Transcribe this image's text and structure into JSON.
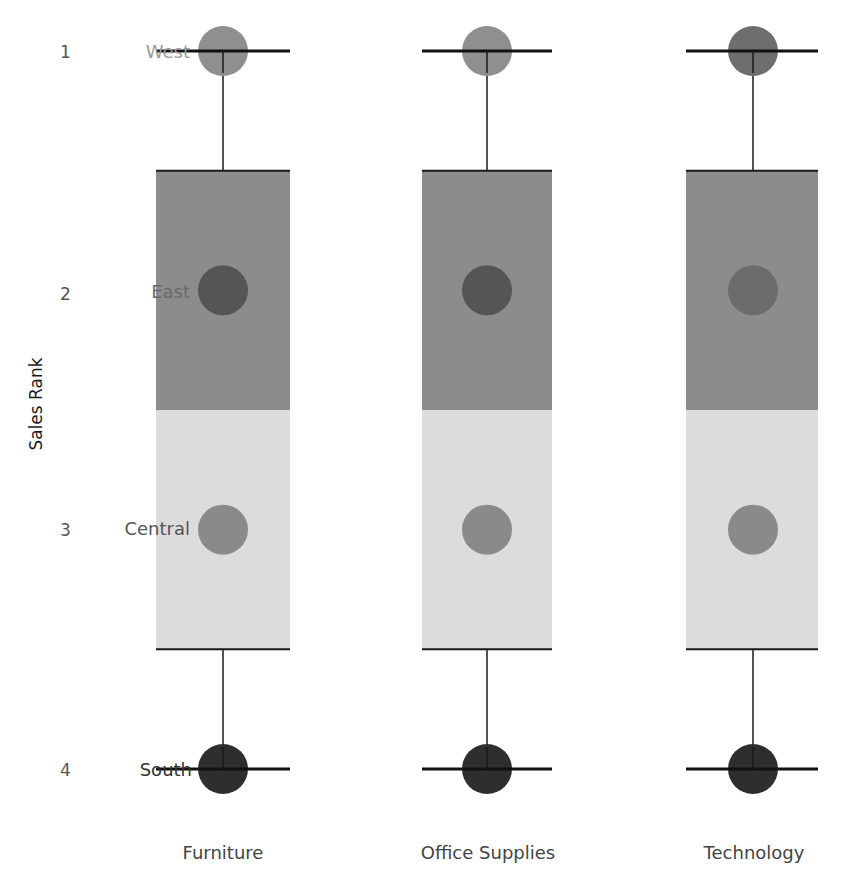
{
  "chart_data": {
    "type": "box-and-dot",
    "title": "",
    "xlabel": "",
    "ylabel": "Sales Rank",
    "ylim": [
      1,
      4
    ],
    "y_ticks": [
      "1",
      "2",
      "3",
      "4"
    ],
    "grid": false,
    "categories": [
      "Furniture",
      "Office Supplies",
      "Technology"
    ],
    "series": [
      {
        "name": "West",
        "values": [
          1,
          1,
          1
        ],
        "colors": [
          "#8f8f8f",
          "#8f8f8f",
          "#6e6e6e"
        ]
      },
      {
        "name": "East",
        "values": [
          2,
          2,
          2
        ],
        "colors": [
          "#555555",
          "#555555",
          "#6c6c6c"
        ]
      },
      {
        "name": "Central",
        "values": [
          3,
          3,
          3
        ],
        "colors": [
          "#8a8a8a",
          "#8a8a8a",
          "#8a8a8a"
        ]
      },
      {
        "name": "South",
        "values": [
          4,
          4,
          4
        ],
        "colors": [
          "#2e2e2e",
          "#2e2e2e",
          "#2e2e2e"
        ]
      }
    ],
    "box_plot": {
      "whisker_low": 1,
      "q1": 1.5,
      "median": 2.5,
      "q3": 3.5,
      "whisker_high": 4,
      "upper_box_color": "#8c8c8c",
      "lower_box_color": "#dcdcdc"
    },
    "row_labels": [
      {
        "text": "West",
        "rank": 1,
        "color": "#9a9a9a"
      },
      {
        "text": "East",
        "rank": 2,
        "color": "#6a6a6a"
      },
      {
        "text": "Central",
        "rank": 3,
        "color": "#555555"
      },
      {
        "text": "South",
        "rank": 4,
        "color": "#333333"
      }
    ]
  },
  "axis": {
    "y_title": "Sales Rank",
    "y_ticks": [
      "1",
      "2",
      "3",
      "4"
    ],
    "x_ticks": [
      "Furniture",
      "Office Supplies",
      "Technology"
    ]
  },
  "labels": {
    "west": "West",
    "east": "East",
    "central": "Central",
    "south": "South"
  }
}
